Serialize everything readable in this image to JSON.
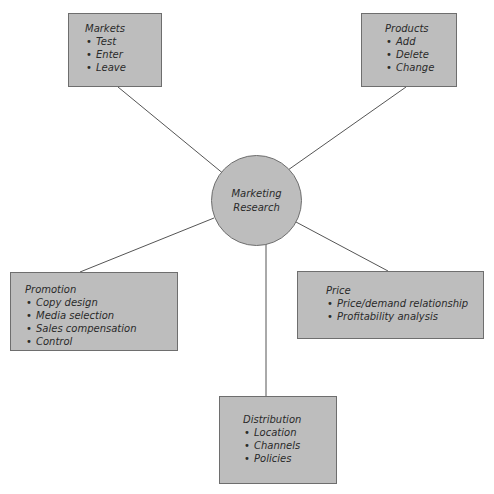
{
  "diagram": {
    "colors": {
      "box_fill": "#bdbdbd",
      "box_border": "#6e6e6e",
      "line": "#555555",
      "text": "#2a2a2a"
    },
    "center": {
      "label_line1": "Marketing",
      "label_line2": "Research"
    },
    "nodes": {
      "markets": {
        "title": "Markets",
        "items": [
          "Test",
          "Enter",
          "Leave"
        ]
      },
      "products": {
        "title": "Products",
        "items": [
          "Add",
          "Delete",
          "Change"
        ]
      },
      "promotion": {
        "title": "Promotion",
        "items": [
          "Copy design",
          "Media selection",
          "Sales compensation",
          "Control"
        ]
      },
      "price": {
        "title": "Price",
        "items": [
          "Price/demand relationship",
          "Profitability analysis"
        ]
      },
      "distribution": {
        "title": "Distribution",
        "items": [
          "Location",
          "Channels",
          "Policies"
        ]
      }
    }
  }
}
